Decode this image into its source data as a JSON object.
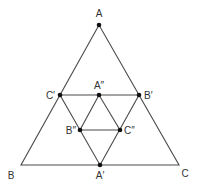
{
  "diagram": {
    "title": "",
    "colors": {
      "line": "#4a4a4a",
      "point": "#111111",
      "label": "#333333",
      "background": "#ffffff"
    },
    "points": [
      {
        "id": "A",
        "label": "A",
        "x": 99,
        "y": 25,
        "marked": true,
        "lx": 99,
        "ly": 17,
        "anchor": "middle"
      },
      {
        "id": "B",
        "label": "B",
        "x": 21,
        "y": 165,
        "marked": false,
        "lx": 11,
        "ly": 179,
        "anchor": "middle"
      },
      {
        "id": "C",
        "label": "C",
        "x": 179,
        "y": 165,
        "marked": false,
        "lx": 185,
        "ly": 177,
        "anchor": "middle"
      },
      {
        "id": "A1",
        "label": "A′",
        "x": 100,
        "y": 165,
        "marked": true,
        "lx": 100,
        "ly": 179,
        "anchor": "middle"
      },
      {
        "id": "B1",
        "label": "B′",
        "x": 139,
        "y": 95,
        "marked": true,
        "lx": 144,
        "ly": 99,
        "anchor": "start"
      },
      {
        "id": "C1",
        "label": "C′",
        "x": 60,
        "y": 95,
        "marked": true,
        "lx": 55,
        "ly": 99,
        "anchor": "end"
      },
      {
        "id": "A2",
        "label": "A″",
        "x": 99,
        "y": 95,
        "marked": true,
        "lx": 99,
        "ly": 89,
        "anchor": "middle"
      },
      {
        "id": "B2",
        "label": "B″",
        "x": 80,
        "y": 130,
        "marked": true,
        "lx": 76,
        "ly": 134,
        "anchor": "end"
      },
      {
        "id": "C2",
        "label": "C″",
        "x": 120,
        "y": 130,
        "marked": true,
        "lx": 124,
        "ly": 134,
        "anchor": "start"
      }
    ],
    "triangles": [
      {
        "name": "ABC",
        "vertices": [
          "A",
          "B",
          "C"
        ]
      },
      {
        "name": "A′B′C′",
        "vertices": [
          "A1",
          "B1",
          "C1"
        ]
      },
      {
        "name": "A″B″C″",
        "vertices": [
          "A2",
          "B2",
          "C2"
        ]
      }
    ]
  }
}
